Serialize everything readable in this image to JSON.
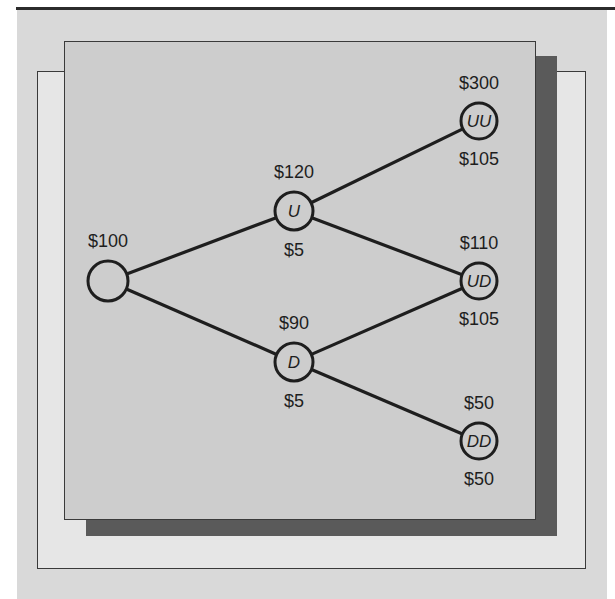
{
  "diagram": {
    "type": "binomial-tree",
    "nodes": [
      {
        "id": "root",
        "label": "",
        "cx": 108,
        "cy": 281,
        "r": 20,
        "top_value": "$100",
        "bottom_value": ""
      },
      {
        "id": "U",
        "label": "U",
        "cx": 294,
        "cy": 211,
        "r": 19,
        "top_value": "$120",
        "bottom_value": "$5"
      },
      {
        "id": "D",
        "label": "D",
        "cx": 294,
        "cy": 362,
        "r": 19,
        "top_value": "$90",
        "bottom_value": "$5"
      },
      {
        "id": "UU",
        "label": "UU",
        "cx": 479,
        "cy": 121,
        "r": 18,
        "top_value": "$300",
        "bottom_value": "$105"
      },
      {
        "id": "UD",
        "label": "UD",
        "cx": 479,
        "cy": 281,
        "r": 18,
        "top_value": "$110",
        "bottom_value": "$105"
      },
      {
        "id": "DD",
        "label": "DD",
        "cx": 479,
        "cy": 441,
        "r": 18,
        "top_value": "$50",
        "bottom_value": "$50"
      }
    ],
    "edges": [
      {
        "from": "root",
        "to": "U"
      },
      {
        "from": "root",
        "to": "D"
      },
      {
        "from": "U",
        "to": "UU"
      },
      {
        "from": "U",
        "to": "UD"
      },
      {
        "from": "D",
        "to": "UD"
      },
      {
        "from": "D",
        "to": "DD"
      }
    ]
  },
  "colors": {
    "panel_bg": "#d9d9d9",
    "main_box": "#cdcdcd",
    "shadow": "#5a5a5a",
    "light_box": "#e6e6e6",
    "stroke": "#1e1e1e"
  }
}
